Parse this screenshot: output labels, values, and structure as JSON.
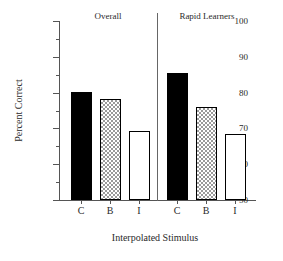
{
  "chart_data": {
    "type": "bar",
    "title": "",
    "xlabel": "Interpolated Stimulus",
    "ylabel": "Percent Correct",
    "ylim": [
      50,
      100
    ],
    "ytick_major": [
      100,
      90,
      80,
      70,
      60,
      50
    ],
    "ytick_minor": [
      95,
      85,
      75,
      65,
      55
    ],
    "grid": false,
    "legend": "none",
    "categories": [
      "C",
      "B",
      "I"
    ],
    "panels": [
      {
        "name": "Overall",
        "categories": [
          "C",
          "B",
          "I"
        ],
        "values": [
          80.1,
          78.2,
          69.3
        ],
        "fills": [
          "solid",
          "checker",
          "open"
        ]
      },
      {
        "name": "Rapid Learners",
        "categories": [
          "C",
          "B",
          "I"
        ],
        "values": [
          85.5,
          76.1,
          68.3
        ],
        "fills": [
          "solid",
          "checker",
          "open"
        ]
      }
    ],
    "colors": {
      "solid": "#000000",
      "checker": "#9a9a9a",
      "open": "#ffffff",
      "axis": "#555555",
      "text": "#2a2a2a"
    }
  }
}
